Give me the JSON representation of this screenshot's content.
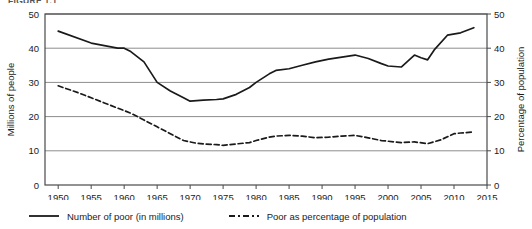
{
  "figure": {
    "label": "FIGURE 1.1"
  },
  "chart_data": {
    "type": "line",
    "title": "",
    "xlabel": "",
    "ylabel": "Millions of people",
    "y2label": "Percentage of population",
    "xlim": [
      1948,
      2015
    ],
    "ylim": [
      0,
      50
    ],
    "y2lim": [
      0,
      50
    ],
    "xticks": [
      1950,
      1955,
      1960,
      1965,
      1970,
      1975,
      1980,
      1985,
      1990,
      1995,
      2000,
      2005,
      2010,
      2015
    ],
    "xticklabels": [
      "1950",
      "1955",
      "1960",
      "1965",
      "1970",
      "1975",
      "1980",
      "1985",
      "1990",
      "1995",
      "2000",
      "2005",
      "2010",
      "2015"
    ],
    "yticks": [
      0,
      10,
      20,
      30,
      40,
      50
    ],
    "yticklabels": [
      "0",
      "10",
      "20",
      "30",
      "40",
      "50"
    ],
    "y2ticks": [
      0,
      10,
      20,
      30,
      40,
      50
    ],
    "y2ticklabels": [
      "0",
      "10",
      "20",
      "30",
      "40",
      "50"
    ],
    "grid": "horizontal",
    "legend_position": "below",
    "series": [
      {
        "name": "Number of poor (in millions)",
        "axis": "left",
        "style": "solid",
        "color": "#1a1a1a",
        "x": [
          1950,
          1955,
          1959,
          1960,
          1961,
          1963,
          1965,
          1967,
          1969,
          1970,
          1972,
          1974,
          1975,
          1977,
          1979,
          1980,
          1982,
          1983,
          1985,
          1987,
          1989,
          1991,
          1993,
          1995,
          1997,
          1999,
          2000,
          2002,
          2004,
          2005,
          2006,
          2007,
          2009,
          2011,
          2013
        ],
        "values": [
          45.0,
          41.5,
          40.0,
          40.0,
          39.0,
          36.0,
          30.0,
          27.5,
          25.5,
          24.5,
          24.8,
          25.0,
          25.2,
          26.5,
          28.5,
          30.0,
          32.5,
          33.5,
          34.0,
          35.0,
          36.0,
          36.8,
          37.4,
          38.0,
          37.0,
          35.5,
          34.8,
          34.5,
          38.0,
          37.2,
          36.6,
          39.5,
          43.8,
          44.5,
          46.0
        ]
      },
      {
        "name": "Poor as percentage of population",
        "axis": "right",
        "style": "dashed",
        "color": "#1a1a1a",
        "x": [
          1950,
          1953,
          1955,
          1957,
          1959,
          1961,
          1963,
          1965,
          1967,
          1969,
          1971,
          1972,
          1974,
          1975,
          1977,
          1979,
          1980,
          1982,
          1983,
          1985,
          1987,
          1989,
          1991,
          1993,
          1995,
          1997,
          1999,
          2001,
          2002,
          2004,
          2006,
          2008,
          2010,
          2011,
          2013
        ],
        "values": [
          29.0,
          27.0,
          25.5,
          24.0,
          22.5,
          21.0,
          19.0,
          17.0,
          15.0,
          13.0,
          12.2,
          12.0,
          11.8,
          11.6,
          12.0,
          12.4,
          13.0,
          14.0,
          14.3,
          14.5,
          14.3,
          13.8,
          14.0,
          14.3,
          14.5,
          13.8,
          13.0,
          12.6,
          12.4,
          12.6,
          12.1,
          13.2,
          15.0,
          15.2,
          15.5
        ]
      }
    ]
  },
  "legend": {
    "items": [
      {
        "label": "Number of poor (in millions)",
        "style": "solid"
      },
      {
        "label": "Poor as percentage of population",
        "style": "dashed"
      }
    ]
  }
}
